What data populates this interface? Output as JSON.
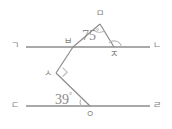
{
  "figure": {
    "type": "geometry-diagram",
    "background_color": "#ffffff",
    "line_color": "#8c8c8c",
    "label_color": "#7d7d7d",
    "marker_color": "#b0b0b0",
    "width": 172,
    "height": 129
  },
  "lines": {
    "upper": {
      "name": "line-gana",
      "left_label": "ㄱ",
      "right_label": "ㄴ",
      "y": 47
    },
    "lower": {
      "name": "line-darari",
      "left_label": "ㄷ",
      "right_label": "ㄹ",
      "y": 106
    }
  },
  "points": [
    {
      "label": "ㄱ",
      "name": "point-giyeok",
      "x": 18,
      "y": 47
    },
    {
      "label": "ㄴ",
      "name": "point-nieun",
      "x": 156,
      "y": 47
    },
    {
      "label": "ㄷ",
      "name": "point-digeut",
      "x": 18,
      "y": 106
    },
    {
      "label": "ㄹ",
      "name": "point-rieul",
      "x": 156,
      "y": 106
    },
    {
      "label": "ㅁ",
      "name": "point-mieum",
      "x": 100,
      "y": 22
    },
    {
      "label": "ㅂ",
      "name": "point-bieup",
      "x": 73,
      "y": 47
    },
    {
      "label": "ㅅ",
      "name": "point-siot",
      "x": 56,
      "y": 73
    },
    {
      "label": "ㅇ",
      "name": "point-ieung",
      "x": 90,
      "y": 106
    },
    {
      "label": "ㅈ",
      "name": "point-jieut",
      "x": 114,
      "y": 47
    }
  ],
  "angles": [
    {
      "name": "angle-75",
      "value": "75",
      "unit": "°",
      "at_point": "ㅁ",
      "text_x": 82,
      "text_y": 29
    },
    {
      "name": "angle-39",
      "value": "39",
      "unit": "°",
      "at_point": "ㅇ",
      "text_x": 56,
      "text_y": 93
    }
  ],
  "markers": {
    "right_angle_at_siot": "right-angle-square",
    "arc_at_mieum": "angle-arc",
    "arc_at_jieut": "angle-arc",
    "arc_at_ieung": "angle-arc"
  }
}
